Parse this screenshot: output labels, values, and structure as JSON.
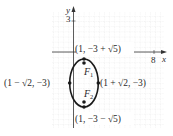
{
  "diagram": {
    "type": "ellipse-on-coordinate-grid",
    "axes": {
      "x_label": "x",
      "y_label": "y",
      "x_tick_label": "8",
      "y_tick_label": "3"
    },
    "ellipse": {
      "center": [
        1,
        -3
      ],
      "semi_major_vertical": "√5",
      "semi_minor_horizontal": "√2"
    },
    "foci": [
      {
        "label": "F",
        "subscript": "1"
      },
      {
        "label": "F",
        "subscript": "2"
      }
    ],
    "vertex_labels": {
      "top": "(1, −3 + √5)",
      "bottom": "(1, −3 − √5)",
      "left": "(1 − √2, −3)",
      "right": "(1 + √2, −3)"
    },
    "colors": {
      "ellipse": "#1a1a1a",
      "axes": "#333333",
      "grid": "#c8c8c8",
      "text": "#2a2a2a"
    }
  }
}
